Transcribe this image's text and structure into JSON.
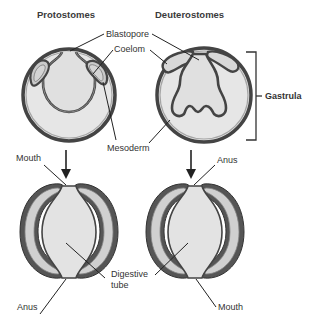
{
  "titles": {
    "left": "Protostomes",
    "right": "Deuterostomes"
  },
  "labels": {
    "blastopore": "Blastopore",
    "coelom": "Coelom",
    "mesoderm": "Mesoderm",
    "gastrula": "Gastrula",
    "mouth_top_left": "Mouth",
    "anus_top_right": "Anus",
    "digestive_line1": "Digestive",
    "digestive_line2": "tube",
    "anus_bottom_left": "Anus",
    "mouth_bottom_right": "Mouth"
  },
  "colors": {
    "outline": "#444444",
    "fill_light": "#e6e6e6",
    "fill_coelom": "#c9c9c9",
    "text": "#333333"
  }
}
